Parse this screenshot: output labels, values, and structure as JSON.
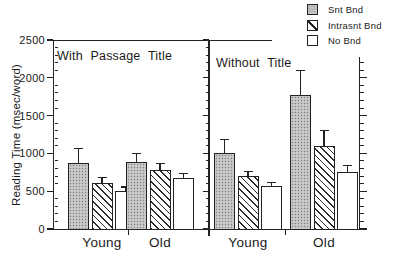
{
  "chart_data": {
    "type": "bar",
    "title": "",
    "xlabel": "",
    "ylabel": "Reading Time (msec/word)",
    "ylim": [
      0,
      2500
    ],
    "yticks": [
      0,
      500,
      1000,
      1500,
      2000,
      2500
    ],
    "minor_tick_interval": 100,
    "grid": false,
    "error_bars": "upper only",
    "legend": {
      "position": "top-right",
      "items": [
        {
          "label": "Snt Bnd",
          "pattern": "gray-stipple"
        },
        {
          "label": "Intrasnt Bnd",
          "pattern": "diagonal-hatch"
        },
        {
          "label": "No Bnd",
          "pattern": "white"
        }
      ]
    },
    "panels": [
      {
        "title": "With Passage Title",
        "categories": [
          "Young",
          "Old"
        ],
        "series": [
          {
            "name": "Snt Bnd",
            "values": [
              875,
              880
            ],
            "errors": [
              190,
              120
            ]
          },
          {
            "name": "Intrasnt Bnd",
            "values": [
              610,
              780
            ],
            "errors": [
              70,
              90
            ]
          },
          {
            "name": "No Bnd",
            "values": [
              500,
              675
            ],
            "errors": [
              55,
              55
            ]
          }
        ]
      },
      {
        "title": "Without Title",
        "categories": [
          "Young",
          "Old"
        ],
        "series": [
          {
            "name": "Snt Bnd",
            "values": [
              1000,
              1775
            ],
            "errors": [
              180,
              325
            ]
          },
          {
            "name": "Intrasnt Bnd",
            "values": [
              695,
              1100
            ],
            "errors": [
              70,
              200
            ]
          },
          {
            "name": "No Bnd",
            "values": [
              570,
              760
            ],
            "errors": [
              50,
              75
            ]
          }
        ]
      }
    ]
  }
}
